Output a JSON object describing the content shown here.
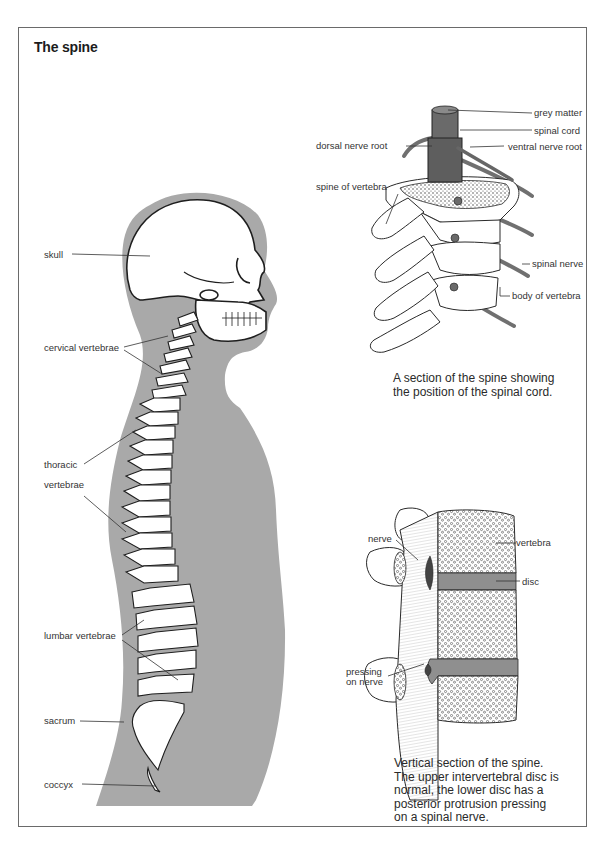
{
  "page": {
    "title": "The spine"
  },
  "colors": {
    "silhouette": "#a9a9a9",
    "nerve": "#7a7a7a",
    "bone_outline": "#2a2a2a",
    "frame": "#6a6a6a",
    "disc": "#8f8f8f"
  },
  "skeleton_figure": {
    "labels": {
      "skull": "skull",
      "cervical": "cervical vertebrae",
      "thoracic_1": "thoracic",
      "thoracic_2": "vertebrae",
      "lumbar": "lumbar vertebrae",
      "sacrum": "sacrum",
      "coccyx": "coccyx"
    }
  },
  "section_figure": {
    "labels": {
      "grey_matter": "grey matter",
      "spinal_cord": "spinal cord",
      "dorsal_root": "dorsal nerve root",
      "ventral_root": "ventral nerve root",
      "spine_of_vertebra": "spine of vertebra",
      "spinal_nerve": "spinal nerve",
      "body_of_vertebra": "body of vertebra"
    },
    "caption_1": "A section of the spine showing",
    "caption_2": "the position of the spinal cord."
  },
  "vertical_figure": {
    "labels": {
      "nerve": "nerve",
      "vertebra": "vertebra",
      "disc": "disc",
      "pressing_1": "pressing",
      "pressing_2": "on nerve"
    },
    "caption_lines": [
      "Vertical section of the spine.",
      "The upper intervertebral disc is",
      "normal, the lower disc has a",
      "posterior protrusion pressing",
      "on a spinal nerve."
    ]
  }
}
